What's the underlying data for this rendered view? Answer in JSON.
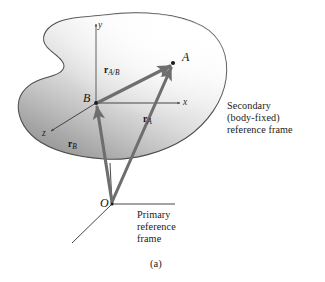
{
  "figure": {
    "caption": "(a)",
    "kind": "vector-kinematics-diagram",
    "points": {
      "A": {
        "label": "A",
        "x": 173,
        "y": 63
      },
      "B": {
        "label": "B",
        "x": 96,
        "y": 103
      },
      "O": {
        "label": "O",
        "x": 112,
        "y": 204
      }
    },
    "axes": {
      "secondary": {
        "x_label": "x",
        "y_label": "y",
        "z_label": "z"
      }
    },
    "vectors": [
      {
        "name": "r_A_over_B",
        "symbol": "r",
        "subscript": "A/B",
        "from": "B",
        "to": "A",
        "label_x": 104,
        "label_y": 71
      },
      {
        "name": "r_A",
        "symbol": "r",
        "subscript": "A",
        "from": "O",
        "to": "A",
        "label_x": 143,
        "label_y": 120
      },
      {
        "name": "r_B",
        "symbol": "r",
        "subscript": "B",
        "from": "O",
        "to": "B",
        "label_x": 68,
        "label_y": 145
      }
    ],
    "annotations": {
      "secondary_frame": {
        "line1": "Secondary",
        "line2": "(body-fixed)",
        "line3": "reference frame",
        "x": 227,
        "y": 107
      },
      "primary_frame": {
        "line1": "Primary",
        "line2": "reference",
        "line3": "frame",
        "x": 137,
        "y": 215
      }
    },
    "colors": {
      "body_fill_light": "#fdfdfd",
      "body_fill_dark": "#9a9a9a",
      "body_outline": "#4a4a4a",
      "vector_stroke": "#6e6e6e",
      "axis_stroke": "#3d3d3d",
      "text": "#161616",
      "background": "#ffffff"
    }
  }
}
